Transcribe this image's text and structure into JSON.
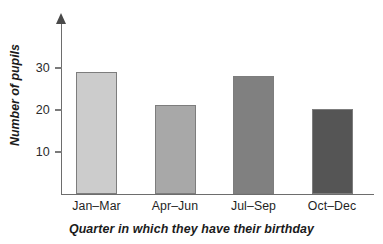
{
  "chart_data": {
    "type": "bar",
    "title": "",
    "xlabel": "Quarter in which they have their birthday",
    "ylabel": "Number of pupils",
    "categories": [
      "Jan–Mar",
      "Apr–Jun",
      "Jul–Sep",
      "Oct–Dec"
    ],
    "values": [
      29,
      21.3,
      28,
      20.3
    ],
    "yticks": [
      10,
      20,
      30
    ],
    "ylim": [
      0,
      41
    ],
    "grid": false,
    "legend": null,
    "bar_colors": [
      "#cccccc",
      "#a8a8a8",
      "#808080",
      "#555555"
    ],
    "bar_edge_color": "#7d7d7d",
    "axis_color": "#6d6d6d",
    "series": [
      {
        "name": "Number of pupils",
        "points": [
          {
            "category": "Jan–Mar",
            "value": 29
          },
          {
            "category": "Apr–Jun",
            "value": 21.3
          },
          {
            "category": "Jul–Sep",
            "value": 28
          },
          {
            "category": "Oct–Dec",
            "value": 20.3
          }
        ]
      }
    ]
  },
  "axes": {
    "y_title": "Number of pupils",
    "x_title": "Quarter in which they have their birthday",
    "y_tick_labels": [
      "30",
      "20",
      "10"
    ]
  },
  "bars": [
    {
      "label": "Jan–Mar",
      "value": 29,
      "color": "#cccccc"
    },
    {
      "label": "Apr–Jun",
      "value": 21.3,
      "color": "#a8a8a8"
    },
    {
      "label": "Jul–Sep",
      "value": 28,
      "color": "#808080"
    },
    {
      "label": "Oct–Dec",
      "value": 20.3,
      "color": "#555555"
    }
  ]
}
